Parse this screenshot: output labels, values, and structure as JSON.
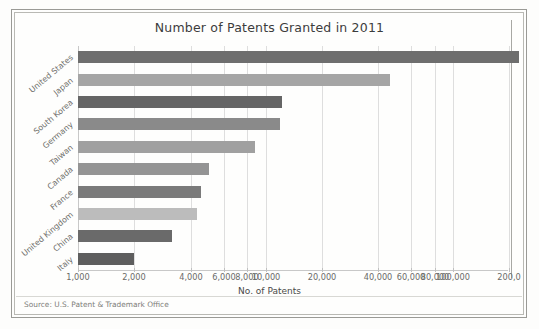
{
  "figure": {
    "title": "Number of Patents Granted in 2011",
    "source_note": "Source: U.S. Patent & Trademark Office"
  },
  "chart_data": {
    "type": "bar",
    "orientation": "horizontal",
    "title": "Number of Patents Granted in 2011",
    "xlabel": "No. of Patents",
    "ylabel": "",
    "xscale": "log",
    "xlim": [
      1000,
      250000
    ],
    "grid": "vertical",
    "legend": "none",
    "categories": [
      "United States",
      "Japan",
      "South Korea",
      "Germany",
      "Taiwan",
      "Canada",
      "France",
      "United Kingdom",
      "China",
      "Italy"
    ],
    "values": [
      224505,
      46139,
      12262,
      11920,
      8781,
      5012,
      4531,
      4307,
      3174,
      1987
    ],
    "bar_colors": [
      "#6e6e6e",
      "#a5a5a5",
      "#656565",
      "#8a8a8a",
      "#a0a0a0",
      "#949494",
      "#7a7a7a",
      "#bcbcbc",
      "#6a6a6a",
      "#5e5e5e"
    ],
    "xticks": [
      1000,
      2000,
      4000,
      6000,
      8000,
      10000,
      20000,
      40000,
      60000,
      80000,
      100000,
      200000
    ],
    "xticklabels": [
      "1,000",
      "2,000",
      "4,000",
      "6,000",
      "8,000",
      "10,000",
      "20,000",
      "40,000",
      "60,000",
      "80,000",
      "100,000",
      "200,0"
    ]
  }
}
